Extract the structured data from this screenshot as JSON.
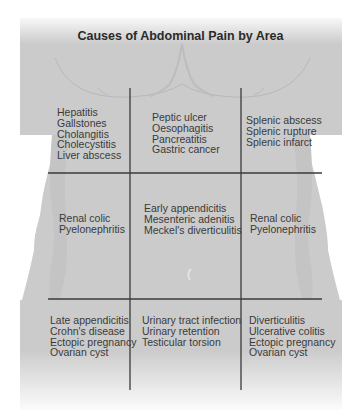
{
  "title": "Causes of Abdominal Pain by Area",
  "colors": {
    "body_fill": "#c9c9c9",
    "grid_line": "#3a3a3a",
    "text": "#3a3a3a",
    "title": "#2a2a2a"
  },
  "regions": {
    "right_hypochondrium": [
      "Hepatitis",
      "Gallstones",
      "Cholangitis",
      "Cholecystitis",
      "Liver abscess"
    ],
    "epigastrium": [
      "Peptic ulcer",
      "Oesophagitis",
      "Pancreatitis",
      "Gastric cancer"
    ],
    "left_hypochondrium": [
      "Splenic abscess",
      "Splenic rupture",
      "Splenic infarct"
    ],
    "right_lumbar": [
      "Renal colic",
      "Pyelonephritis"
    ],
    "umbilical": [
      "Early appendicitis",
      "Mesenteric adenitis",
      "Meckel's diverticulitis"
    ],
    "left_lumbar": [
      "Renal colic",
      "Pyelonephritis"
    ],
    "right_iliac": [
      "Late appendicitis",
      "Crohn's disease",
      "Ectopic pregnancy",
      "Ovarian cyst"
    ],
    "hypogastrium": [
      "Urinary tract infection",
      "Urinary retention",
      "Testicular torsion"
    ],
    "left_iliac": [
      "Diverticulitis",
      "Ulcerative colitis",
      "Ectopic pregnancy",
      "Ovarian cyst"
    ]
  }
}
